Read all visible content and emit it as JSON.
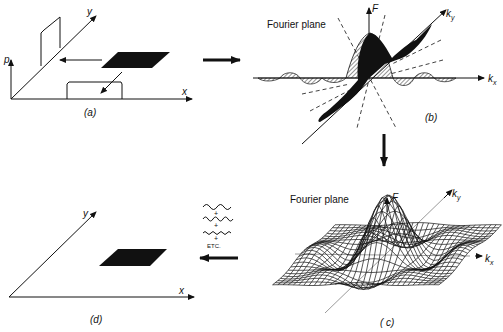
{
  "panels": {
    "a": {
      "caption": "(a)",
      "axis_x": "x",
      "axis_y": "y",
      "axis_p": "p"
    },
    "b": {
      "caption": "(b)",
      "title": "Fourier plane",
      "axis_F": "F",
      "axis_ky": "k",
      "axis_ky_sub": "y",
      "axis_kx": "k",
      "axis_kx_sub": "x"
    },
    "c": {
      "caption": "( c)",
      "title": "Fourier plane",
      "axis_F": "F",
      "axis_ky": "k",
      "axis_ky_sub": "y",
      "axis_kx": "k",
      "axis_kx_sub": "x"
    },
    "d": {
      "caption": "(d)",
      "axis_x": "x",
      "axis_y": "y",
      "sum_plus_1": "+",
      "sum_plus_2": "+",
      "sum_plus_3": "+",
      "sum_etc": "ETC."
    }
  },
  "colors": {
    "ink": "#111111",
    "background": "#ffffff"
  }
}
